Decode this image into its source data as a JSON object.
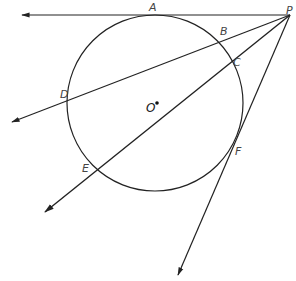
{
  "diagram": {
    "type": "geometry",
    "colors": {
      "stroke": "#222222",
      "label": "#444444",
      "background": "#ffffff"
    },
    "circle": {
      "center_label": "O",
      "cx": 155,
      "cy": 103,
      "r": 88
    },
    "points": {
      "A": {
        "label": "A",
        "x": 155,
        "y": 15
      },
      "B": {
        "label": "B",
        "x": 218,
        "y": 41
      },
      "C": {
        "label": "C",
        "x": 230,
        "y": 60
      },
      "D": {
        "label": "D",
        "x": 69,
        "y": 97
      },
      "E": {
        "label": "E",
        "x": 97,
        "y": 168
      },
      "F": {
        "label": "F",
        "x": 235,
        "y": 142
      },
      "P": {
        "label": "P",
        "x": 290,
        "y": 15
      },
      "O": {
        "label": "O",
        "x": 155,
        "y": 103
      }
    },
    "lines": [
      {
        "name": "tangent-PA",
        "from": "P",
        "through": "A",
        "end": [
          22,
          15
        ],
        "arrow": true
      },
      {
        "name": "secant-PBD",
        "from": "P",
        "through": [
          "B",
          "D"
        ],
        "end": [
          12,
          122
        ],
        "arrow": true
      },
      {
        "name": "secant-PCE",
        "from": "P",
        "through": [
          "C",
          "E"
        ],
        "end": [
          45,
          212
        ],
        "arrow": true
      },
      {
        "name": "tangent-PF",
        "from": "P",
        "through": "F",
        "end": [
          178,
          275
        ],
        "arrow": true
      }
    ]
  }
}
